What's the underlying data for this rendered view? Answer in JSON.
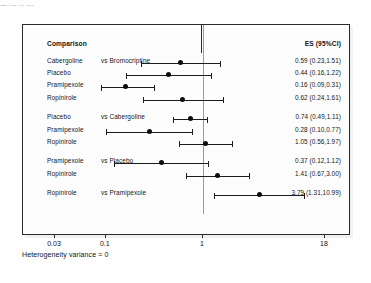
{
  "top_fragment": "— --- -- ---",
  "headers": {
    "comparison": "Comparison",
    "es": "ES (95%CI)"
  },
  "footer": "Heterogeneity variance = 0",
  "axis": {
    "scale": "log",
    "ticks": [
      {
        "label": "0.03",
        "value": 0.03
      },
      {
        "label": "0.1",
        "value": 0.1
      },
      {
        "label": "1",
        "value": 1
      },
      {
        "label": "18",
        "value": 18
      }
    ],
    "reference_line": 1
  },
  "chart_data": {
    "type": "forest",
    "title": "",
    "xlabel": "",
    "ylabel": "",
    "xscale": "log",
    "xlim": [
      0.03,
      18
    ],
    "reference_line": 1,
    "grid": false,
    "legend": "none",
    "annotation": "Heterogeneity variance = 0",
    "columns": [
      "Comparison",
      "ES (95%CI)"
    ],
    "groups": [
      {
        "reference": "Bromocriptine",
        "rows": [
          {
            "treatment": "Cabergoline",
            "vs": "vs Bromocriptine",
            "es": 0.59,
            "lcl": 0.23,
            "ucl": 1.51,
            "es_text": "0.59 (0.23,1.51)"
          },
          {
            "treatment": "Placebo",
            "vs": "",
            "es": 0.44,
            "lcl": 0.16,
            "ucl": 1.22,
            "es_text": "0.44 (0.16,1.22)"
          },
          {
            "treatment": "Pramipexole",
            "vs": "",
            "es": 0.16,
            "lcl": 0.09,
            "ucl": 0.31,
            "es_text": "0.16 (0.09,0.31)"
          },
          {
            "treatment": "Ropinirole",
            "vs": "",
            "es": 0.62,
            "lcl": 0.24,
            "ucl": 1.61,
            "es_text": "0.62 (0.24,1.61)"
          }
        ]
      },
      {
        "reference": "Cabergoline",
        "rows": [
          {
            "treatment": "Placebo",
            "vs": "vs Cabergoline",
            "es": 0.74,
            "lcl": 0.49,
            "ucl": 1.11,
            "es_text": "0.74 (0.49,1.11)"
          },
          {
            "treatment": "Pramipexole",
            "vs": "",
            "es": 0.28,
            "lcl": 0.1,
            "ucl": 0.77,
            "es_text": "0.28 (0.10,0.77)"
          },
          {
            "treatment": "Ropinirole",
            "vs": "",
            "es": 1.05,
            "lcl": 0.56,
            "ucl": 1.97,
            "es_text": "1.05 (0.56,1.97)"
          }
        ]
      },
      {
        "reference": "Placebo",
        "rows": [
          {
            "treatment": "Pramipexole",
            "vs": "vs Placebo",
            "es": 0.37,
            "lcl": 0.12,
            "ucl": 1.12,
            "es_text": "0.37 (0.12,1.12)"
          },
          {
            "treatment": "Ropinirole",
            "vs": "",
            "es": 1.41,
            "lcl": 0.67,
            "ucl": 3.0,
            "es_text": "1.41 (0.67,3.00)"
          }
        ]
      },
      {
        "reference": "Pramipexole",
        "rows": [
          {
            "treatment": "Ropinirole",
            "vs": "vs Pramipexole",
            "es": 3.79,
            "lcl": 1.31,
            "ucl": 10.99,
            "es_text": "3.79 (1.31,10.99)"
          }
        ]
      }
    ]
  },
  "colors": {
    "marker": "#0d0d0d",
    "whisker": "#1c1c1c",
    "refline": "#9a9a9a",
    "frame": "#2b2b2b",
    "text": "#161616"
  }
}
